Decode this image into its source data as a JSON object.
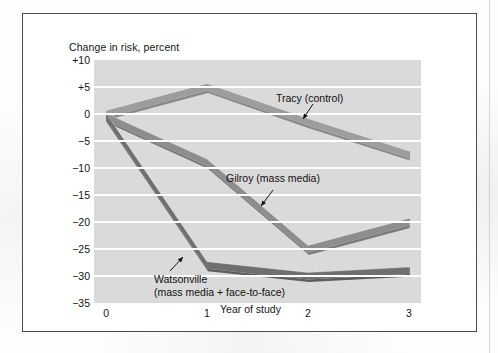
{
  "figure": {
    "background_color": "#ffffff",
    "frame_color": "#4a4a4f",
    "plot_background": "#dadada",
    "gridline_color": "#ffffff"
  },
  "chart_data": {
    "type": "line",
    "title": "",
    "xlabel": "Year of study",
    "ylabel": "Change in risk, percent",
    "x": [
      0,
      1,
      2,
      3
    ],
    "xtick_labels": [
      "0",
      "1",
      "2",
      "3"
    ],
    "ytick_labels": [
      "+10",
      "+5",
      "0",
      "-5",
      "-10",
      "-15",
      "-20",
      "-25",
      "-30",
      "-35"
    ],
    "ytick_values": [
      10,
      5,
      0,
      -5,
      -10,
      -15,
      -20,
      -25,
      -30,
      -35
    ],
    "xlim": [
      -0.12,
      3.12
    ],
    "ylim": [
      -35,
      10
    ],
    "grid": true,
    "grid_axis": "y",
    "legend": "annotations-on-plot",
    "series": [
      {
        "name": "Tracy (control)",
        "label": "Tracy (control)",
        "color": "#9d9d9d",
        "edge_color": "#8a8a8a",
        "values": [
          0,
          5,
          -1.5,
          -7.5
        ]
      },
      {
        "name": "Gilroy (mass media)",
        "label": "Gilroy (mass media)",
        "color": "#8d8d8d",
        "edge_color": "#7b7b7b",
        "values": [
          -0.5,
          -9,
          -25,
          -20
        ]
      },
      {
        "name": "Watsonville (mass media + face-to-face)",
        "label": "Watsonville",
        "label_line2": "(mass media + face-to-face)",
        "color": "#6f6f6f",
        "edge_color": "#5d5d5d",
        "values": [
          -0.5,
          -28,
          -30,
          -29
        ]
      }
    ],
    "annotations": [
      {
        "text": "Tracy (control)",
        "target_series": "Tracy (control)",
        "arrow": "down-left"
      },
      {
        "text": "Gilroy (mass media)",
        "target_series": "Gilroy (mass media)",
        "arrow": "down-left"
      },
      {
        "text": "Watsonville",
        "text_line2": "(mass media + face-to-face)",
        "target_series": "Watsonville (mass media + face-to-face)",
        "arrow": "up-right"
      }
    ]
  }
}
